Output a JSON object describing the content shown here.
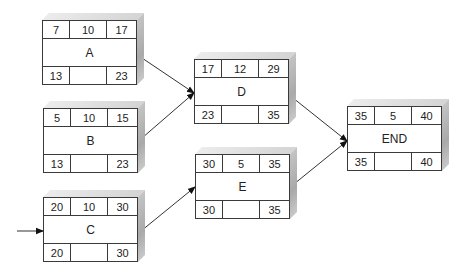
{
  "diagram": {
    "type": "activity-on-node network",
    "nodes": [
      {
        "id": "A",
        "label": "A",
        "early_start": "7",
        "duration": "10",
        "early_finish": "17",
        "late_start": "13",
        "slack": "",
        "late_finish": "23"
      },
      {
        "id": "B",
        "label": "B",
        "early_start": "5",
        "duration": "10",
        "early_finish": "15",
        "late_start": "13",
        "slack": "",
        "late_finish": "23"
      },
      {
        "id": "C",
        "label": "C",
        "early_start": "20",
        "duration": "10",
        "early_finish": "30",
        "late_start": "20",
        "slack": "",
        "late_finish": "30"
      },
      {
        "id": "D",
        "label": "D",
        "early_start": "17",
        "duration": "12",
        "early_finish": "29",
        "late_start": "23",
        "slack": "",
        "late_finish": "35"
      },
      {
        "id": "E",
        "label": "E",
        "early_start": "30",
        "duration": "5",
        "early_finish": "35",
        "late_start": "30",
        "slack": "",
        "late_finish": "35"
      },
      {
        "id": "END",
        "label": "END",
        "early_start": "35",
        "duration": "5",
        "early_finish": "40",
        "late_start": "35",
        "slack": "",
        "late_finish": "40"
      }
    ],
    "edges": [
      {
        "from": "start",
        "to": "C"
      },
      {
        "from": "A",
        "to": "D"
      },
      {
        "from": "B",
        "to": "D"
      },
      {
        "from": "C",
        "to": "E"
      },
      {
        "from": "D",
        "to": "END"
      },
      {
        "from": "E",
        "to": "END"
      }
    ]
  }
}
